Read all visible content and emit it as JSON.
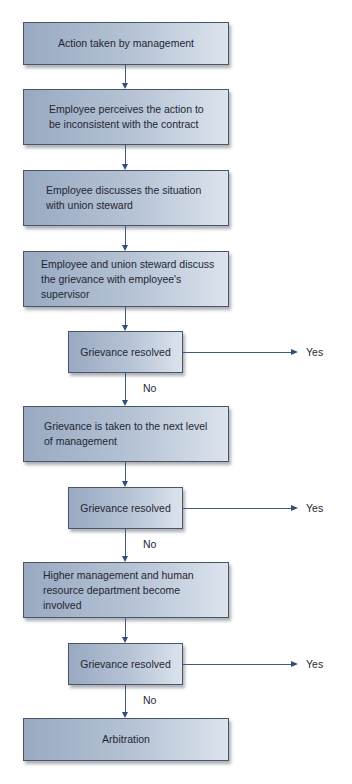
{
  "flowchart": {
    "steps": [
      {
        "id": "s1",
        "text": "Action taken by management"
      },
      {
        "id": "s2",
        "text": "Employee perceives the action to be inconsistent with the contract"
      },
      {
        "id": "s3",
        "text": "Employee discusses the situation with union steward"
      },
      {
        "id": "s4",
        "text": "Employee and union steward discuss the grievance with employee's supervisor"
      },
      {
        "id": "d1",
        "text": "Grievance resolved"
      },
      {
        "id": "s5",
        "text": "Grievance is taken to the next level of management"
      },
      {
        "id": "d2",
        "text": "Grievance resolved"
      },
      {
        "id": "s6",
        "text": "Higher management and human resource department become involved"
      },
      {
        "id": "d3",
        "text": "Grievance resolved"
      },
      {
        "id": "s7",
        "text": "Arbitration"
      }
    ],
    "decisions": [
      {
        "yes_label": "Yes",
        "no_label": "No"
      },
      {
        "yes_label": "Yes",
        "no_label": "No"
      },
      {
        "yes_label": "Yes",
        "no_label": "No"
      }
    ]
  },
  "colors": {
    "box_gradient_start": "#98a9c1",
    "box_gradient_end": "#dbe3ed",
    "box_border": "#4a5567",
    "connector": "#3d5b82"
  }
}
